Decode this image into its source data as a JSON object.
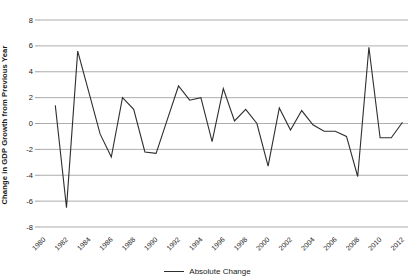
{
  "chart_data": {
    "type": "line",
    "title": "",
    "ylabel": "Change in GDP Growth from Previous Year",
    "xlabel": "",
    "legend": [
      "Absolute Change"
    ],
    "legend_position": "bottom-center",
    "grid": "horizontal",
    "ylim": [
      -8,
      8
    ],
    "yticks": [
      8,
      6,
      4,
      2,
      0,
      -2,
      -4,
      -6,
      -8
    ],
    "xtick_labels": [
      "1980",
      "1982",
      "1984",
      "1986",
      "1988",
      "1990",
      "1992",
      "1994",
      "1996",
      "1998",
      "2000",
      "2002",
      "2004",
      "2006",
      "2008",
      "2010",
      "2012"
    ],
    "xtick_years": [
      1980,
      1982,
      1984,
      1986,
      1988,
      1990,
      1992,
      1994,
      1996,
      1998,
      2000,
      2002,
      2004,
      2006,
      2008,
      2010,
      2012
    ],
    "x_range_years": [
      1980,
      2012
    ],
    "series": [
      {
        "name": "Absolute Change",
        "x": [
          1981,
          1982,
          1983,
          1984,
          1985,
          1986,
          1987,
          1988,
          1989,
          1990,
          1991,
          1992,
          1993,
          1994,
          1995,
          1996,
          1997,
          1998,
          1999,
          2000,
          2001,
          2002,
          2003,
          2004,
          2005,
          2006,
          2007,
          2008,
          2009,
          2010,
          2011,
          2012
        ],
        "values": [
          1.4,
          -6.5,
          5.6,
          2.4,
          -0.8,
          -2.6,
          2.0,
          1.1,
          -2.2,
          -2.3,
          0.3,
          2.9,
          1.8,
          2.0,
          -1.4,
          2.7,
          0.2,
          1.1,
          0.0,
          -3.3,
          1.2,
          -0.5,
          1.0,
          -0.1,
          -0.6,
          -0.6,
          -1.0,
          -4.1,
          5.9,
          -1.1,
          -1.1,
          0.1
        ]
      }
    ],
    "colors": {
      "line": "#2e2e2e",
      "grid": "#999999",
      "tick_text": "#1a1a1a",
      "background": "#ffffff"
    }
  }
}
